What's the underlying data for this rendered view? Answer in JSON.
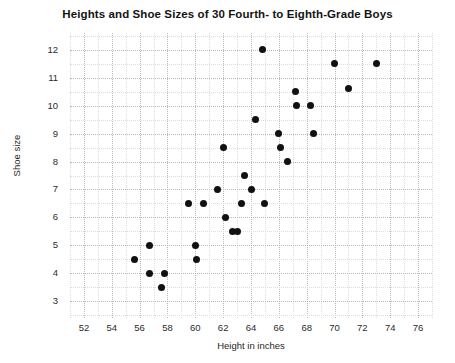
{
  "chart_data": {
    "type": "scatter",
    "title": "Heights and Shoe Sizes of 30 Fourth- to Eighth-Grade Boys",
    "xlabel": "Height in inches",
    "ylabel": "Shoe size",
    "xlim": [
      51,
      77
    ],
    "ylim": [
      2.4,
      12.6
    ],
    "xticks": [
      52,
      54,
      56,
      58,
      60,
      62,
      64,
      66,
      68,
      70,
      72,
      74,
      76
    ],
    "yticks": [
      3,
      4,
      5,
      6,
      7,
      8,
      9,
      10,
      11,
      12
    ],
    "grid": true,
    "grid_style": "dotted",
    "legend": null,
    "marker": "filled-circle",
    "marker_color": "#111111",
    "n_points": 30,
    "points": [
      {
        "x": 55.6,
        "y": 4.5
      },
      {
        "x": 56.7,
        "y": 5.0
      },
      {
        "x": 56.7,
        "y": 4.0
      },
      {
        "x": 57.8,
        "y": 4.0
      },
      {
        "x": 57.6,
        "y": 3.5
      },
      {
        "x": 59.5,
        "y": 6.5
      },
      {
        "x": 60.6,
        "y": 6.5
      },
      {
        "x": 60.0,
        "y": 5.0
      },
      {
        "x": 60.1,
        "y": 4.5
      },
      {
        "x": 61.6,
        "y": 7.0
      },
      {
        "x": 62.0,
        "y": 8.5
      },
      {
        "x": 62.2,
        "y": 6.0
      },
      {
        "x": 62.7,
        "y": 5.5
      },
      {
        "x": 63.5,
        "y": 7.5
      },
      {
        "x": 63.3,
        "y": 6.5
      },
      {
        "x": 63.0,
        "y": 5.5
      },
      {
        "x": 64.0,
        "y": 7.0
      },
      {
        "x": 64.3,
        "y": 9.5
      },
      {
        "x": 64.8,
        "y": 12.0
      },
      {
        "x": 65.0,
        "y": 6.5
      },
      {
        "x": 66.0,
        "y": 9.0
      },
      {
        "x": 66.1,
        "y": 8.5
      },
      {
        "x": 66.6,
        "y": 8.0
      },
      {
        "x": 67.2,
        "y": 10.5
      },
      {
        "x": 67.3,
        "y": 10.0
      },
      {
        "x": 68.3,
        "y": 10.0
      },
      {
        "x": 68.5,
        "y": 9.0
      },
      {
        "x": 70.0,
        "y": 11.5
      },
      {
        "x": 71.0,
        "y": 10.6
      },
      {
        "x": 73.0,
        "y": 11.5
      }
    ]
  }
}
